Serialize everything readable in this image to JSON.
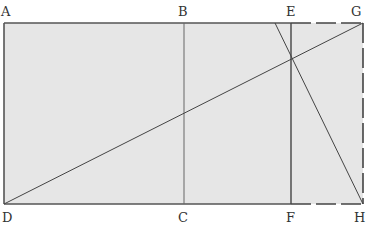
{
  "diagram": {
    "colors": {
      "fill": "#e6e6e6",
      "stroke": "#444444",
      "label": "#333333",
      "background": "#ffffff"
    },
    "points": {
      "A": {
        "label": "A"
      },
      "B": {
        "label": "B"
      },
      "C": {
        "label": "C"
      },
      "D": {
        "label": "D"
      },
      "E": {
        "label": "E"
      },
      "F": {
        "label": "F"
      },
      "G": {
        "label": "G"
      },
      "H": {
        "label": "H"
      }
    },
    "segments": [
      {
        "from": "A",
        "to": "E",
        "style": "solid"
      },
      {
        "from": "D",
        "to": "F",
        "style": "solid"
      },
      {
        "from": "A",
        "to": "D",
        "style": "solid"
      },
      {
        "from": "B",
        "to": "C",
        "style": "solid"
      },
      {
        "from": "E",
        "to": "F",
        "style": "solid"
      },
      {
        "from": "E",
        "to": "G",
        "style": "dashed"
      },
      {
        "from": "F",
        "to": "H",
        "style": "dashed"
      },
      {
        "from": "G",
        "to": "H",
        "style": "dashed"
      },
      {
        "from": "D",
        "to": "G",
        "style": "solid",
        "role": "diagonal"
      },
      {
        "from": "H",
        "to": "top-edge",
        "style": "solid",
        "role": "perpendicular-through-EF-DG-intersection"
      }
    ]
  }
}
